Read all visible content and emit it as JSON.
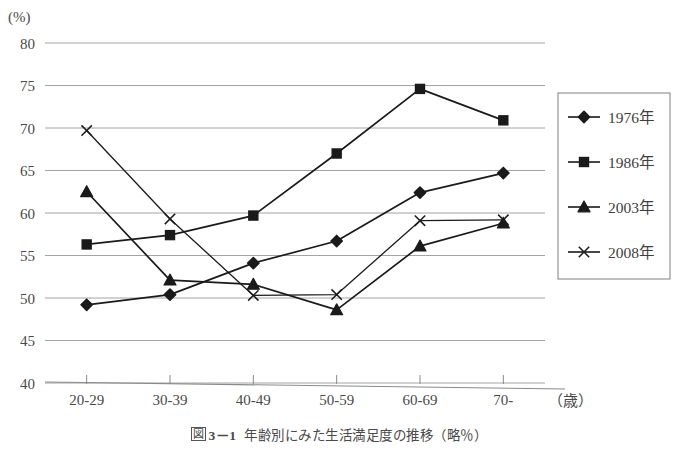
{
  "chart_data": {
    "type": "line",
    "title": "",
    "xlabel": "（歳）",
    "ylabel": "(%)",
    "categories": [
      "20-29",
      "30-39",
      "40-49",
      "50-59",
      "60-69",
      "70-"
    ],
    "ylim": [
      40,
      80
    ],
    "yticks": [
      40,
      45,
      50,
      55,
      60,
      65,
      70,
      75,
      80
    ],
    "grid": true,
    "legend_position": "right",
    "series": [
      {
        "name": "1976年",
        "marker": "diamond",
        "color": "#1a1a1a",
        "values": [
          49.2,
          50.4,
          54.1,
          56.7,
          62.4,
          64.7
        ]
      },
      {
        "name": "1986年",
        "marker": "square",
        "color": "#1a1a1a",
        "values": [
          56.3,
          57.4,
          59.7,
          67.0,
          74.6,
          70.9
        ]
      },
      {
        "name": "2003年",
        "marker": "triangle",
        "color": "#1a1a1a",
        "values": [
          62.5,
          52.1,
          51.6,
          48.6,
          56.1,
          58.8
        ]
      },
      {
        "name": "2008年",
        "marker": "cross",
        "color": "#1a1a1a",
        "values": [
          69.7,
          59.3,
          50.3,
          50.4,
          59.1,
          59.2
        ]
      }
    ]
  },
  "axis": {
    "unit_label": "(%)",
    "x_unit_label": "（歳）"
  },
  "legend": {
    "items": [
      {
        "label": "1976年"
      },
      {
        "label": "1986年"
      },
      {
        "label": "2003年"
      },
      {
        "label": "2008年"
      }
    ]
  },
  "caption": {
    "figure_number": "図",
    "figure_index": "3－1",
    "text": "年齢別にみた生活満足度の推移（略％）"
  }
}
